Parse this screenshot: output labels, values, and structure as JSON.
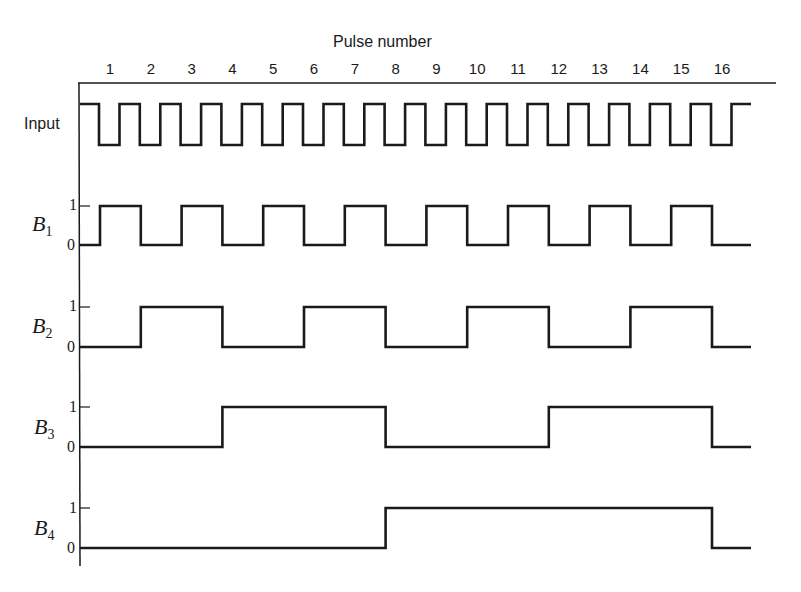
{
  "diagram": {
    "title": "Pulse number",
    "pulse_numbers": [
      "1",
      "2",
      "3",
      "4",
      "5",
      "6",
      "7",
      "8",
      "9",
      "10",
      "11",
      "12",
      "13",
      "14",
      "15",
      "16"
    ],
    "signals": [
      {
        "name": "Input",
        "sub": ""
      },
      {
        "name": "B",
        "sub": "1",
        "tick_high": "1",
        "tick_low": "0"
      },
      {
        "name": "B",
        "sub": "2",
        "tick_high": "1",
        "tick_low": "0"
      },
      {
        "name": "B",
        "sub": "3",
        "tick_high": "1",
        "tick_low": "0"
      },
      {
        "name": "B",
        "sub": "4",
        "tick_high": "1",
        "tick_low": "0"
      }
    ],
    "line_color": "#1a1a1a"
  },
  "chart_data": {
    "type": "line",
    "title": "Pulse number",
    "x": [
      1,
      2,
      3,
      4,
      5,
      6,
      7,
      8,
      9,
      10,
      11,
      12,
      13,
      14,
      15,
      16
    ],
    "series": [
      {
        "name": "Input",
        "description": "square-wave clock, 16 pulses, falling edge at each pulse number"
      },
      {
        "name": "B1",
        "states_after_pulse": [
          1,
          0,
          1,
          0,
          1,
          0,
          1,
          0,
          1,
          0,
          1,
          0,
          1,
          0,
          1,
          0
        ]
      },
      {
        "name": "B2",
        "states_after_pulse": [
          0,
          1,
          1,
          0,
          0,
          1,
          1,
          0,
          0,
          1,
          1,
          0,
          0,
          1,
          1,
          0
        ]
      },
      {
        "name": "B3",
        "states_after_pulse": [
          0,
          0,
          0,
          1,
          1,
          1,
          1,
          0,
          0,
          0,
          0,
          1,
          1,
          1,
          1,
          0
        ]
      },
      {
        "name": "B4",
        "states_after_pulse": [
          0,
          0,
          0,
          0,
          0,
          0,
          0,
          1,
          1,
          1,
          1,
          1,
          1,
          1,
          1,
          0
        ]
      }
    ],
    "ylabel_ticks": [
      "0",
      "1"
    ]
  }
}
